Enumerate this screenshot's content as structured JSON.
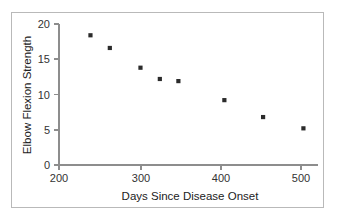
{
  "chart_data": {
    "type": "scatter",
    "title": "",
    "xlabel": "Days Since Disease Onset",
    "ylabel": "Elbow Flexion Strength",
    "xlim": [
      200,
      520
    ],
    "ylim": [
      0,
      20
    ],
    "xticks": [
      200,
      300,
      400,
      500
    ],
    "yticks": [
      0,
      5,
      10,
      15,
      20
    ],
    "xtick_labels": [
      "200",
      "300",
      "400",
      "500"
    ],
    "ytick_labels": [
      "0",
      "5",
      "10",
      "15",
      "20"
    ],
    "grid": false,
    "legend": false,
    "marker_color": "#2b2b2b",
    "marker_shape": "square",
    "axis_color": "#8d8d8d",
    "border_color": "#b9b9b9",
    "background": "#ffffff",
    "x": [
      239,
      263,
      301,
      325,
      348,
      405,
      453,
      503
    ],
    "y": [
      18.4,
      16.6,
      13.8,
      12.2,
      11.9,
      9.2,
      6.8,
      5.2
    ],
    "points": [
      {
        "x": 239,
        "y": 18.4
      },
      {
        "x": 263,
        "y": 16.6
      },
      {
        "x": 301,
        "y": 13.8
      },
      {
        "x": 325,
        "y": 12.2
      },
      {
        "x": 348,
        "y": 11.9
      },
      {
        "x": 405,
        "y": 9.2
      },
      {
        "x": 453,
        "y": 6.8
      },
      {
        "x": 503,
        "y": 5.2
      }
    ]
  }
}
